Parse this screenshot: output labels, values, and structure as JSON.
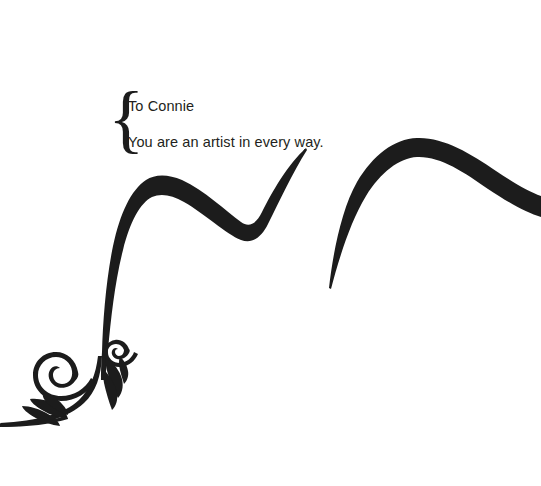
{
  "page": {
    "background_color": "#ffffff",
    "ink_color": "#1c1c1c",
    "width": 541,
    "height": 486
  },
  "message": {
    "brace_glyph": "{",
    "line1": "To Connie",
    "line2": "You are an artist in every way.",
    "text_color": "#231f20"
  },
  "ornament": {
    "swoosh_left_name": "calligraphic-swoosh-left",
    "swoosh_right_name": "calligraphic-swoosh-right",
    "flourish_name": "floral-flourish",
    "stroke_color": "#1c1c1c"
  }
}
